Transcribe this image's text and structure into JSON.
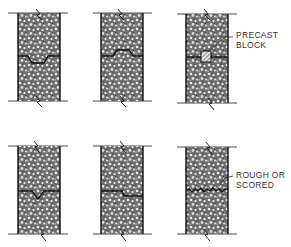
{
  "diagram": {
    "panels": [
      {
        "id": "keyed-recessed",
        "row": 0,
        "col": 0,
        "joint_type": "recessed key"
      },
      {
        "id": "keyed-raised",
        "row": 0,
        "col": 1,
        "joint_type": "raised key"
      },
      {
        "id": "precast-block",
        "row": 0,
        "col": 2,
        "joint_type": "precast block",
        "label": "PRECAST\nBLOCK"
      },
      {
        "id": "v-notch",
        "row": 1,
        "col": 0,
        "joint_type": "v-notch"
      },
      {
        "id": "stepped",
        "row": 1,
        "col": 1,
        "joint_type": "stepped"
      },
      {
        "id": "rough-scored",
        "row": 1,
        "col": 2,
        "joint_type": "rough or scored",
        "label": "ROUGH OR\nSCORED"
      }
    ],
    "labels": {
      "precast_line1": "PRECAST",
      "precast_line2": "BLOCK",
      "rough_line1": "ROUGH OR",
      "rough_line2": "SCORED"
    },
    "colors": {
      "ink": "#1a1a1a",
      "concrete_fill": "#8a8a8a"
    }
  }
}
